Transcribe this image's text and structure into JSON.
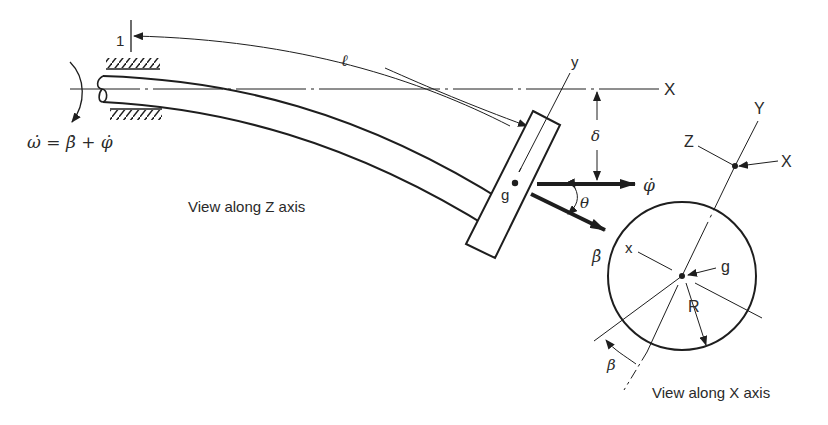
{
  "diagram": {
    "type": "engineering-schematic",
    "colors": {
      "ink": "#1e1e1e",
      "background": "#ffffff"
    },
    "left_view": {
      "caption": "View along Z axis",
      "labels": {
        "station": "1",
        "length": "ℓ",
        "axis_x": "X",
        "axis_y": "y",
        "deflection": "δ",
        "center": "g",
        "phi_dot": "φ̇",
        "beta_dot": "β̇",
        "theta": "θ",
        "omega_eq": "ω̇ = β̇ + φ̇"
      }
    },
    "right_view": {
      "caption": "View along X axis",
      "labels": {
        "axis_Y": "Y",
        "axis_Z": "Z",
        "axis_X": "X",
        "axis_x": "x",
        "center": "g",
        "radius": "R",
        "beta": "β"
      }
    }
  }
}
